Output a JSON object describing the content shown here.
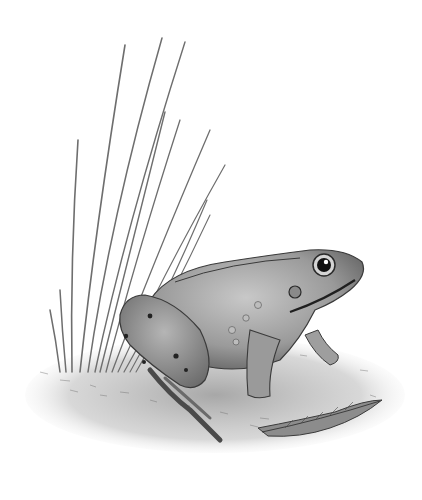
{
  "image": {
    "subject": "frog",
    "style": "pencil illustration",
    "elements": [
      "grass-blades",
      "frog",
      "ground",
      "fallen-leaf"
    ],
    "colors": {
      "background": "#ffffff",
      "graphite_dark": "#2a2a2a",
      "graphite_mid": "#7a7a7a",
      "graphite_light": "#bdbdbd"
    }
  }
}
